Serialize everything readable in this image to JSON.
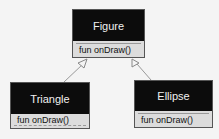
{
  "diagram": {
    "type": "uml-class-diagram",
    "classes": [
      {
        "name": "Figure",
        "methods": [
          "fun onDraw()"
        ]
      },
      {
        "name": "Triangle",
        "methods": [
          "fun onDraw()"
        ]
      },
      {
        "name": "Ellipse",
        "methods": [
          "fun onDraw()"
        ]
      }
    ],
    "relations": [
      {
        "from": "Triangle",
        "to": "Figure",
        "type": "inheritance"
      },
      {
        "from": "Ellipse",
        "to": "Figure",
        "type": "inheritance"
      }
    ],
    "colors": {
      "header": "#0c0c0c",
      "header_text": "#f0f0f0",
      "body": "#dcdcdc",
      "line": "#888888"
    }
  }
}
